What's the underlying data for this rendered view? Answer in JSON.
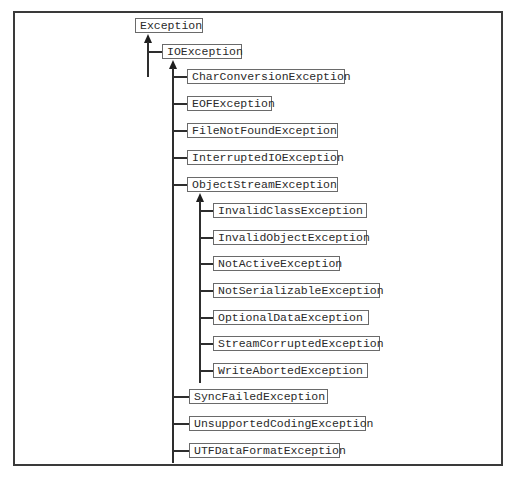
{
  "diagram": {
    "type": "class-hierarchy",
    "root": {
      "label": "Exception",
      "children": [
        {
          "label": "IOException",
          "children": [
            {
              "label": "CharConversionException"
            },
            {
              "label": "EOFException"
            },
            {
              "label": "FileNotFoundException"
            },
            {
              "label": "InterruptedIOException"
            },
            {
              "label": "ObjectStreamException",
              "children": [
                {
                  "label": "InvalidClassException"
                },
                {
                  "label": "InvalidObjectException"
                },
                {
                  "label": "NotActiveException"
                },
                {
                  "label": "NotSerializableException"
                },
                {
                  "label": "OptionalDataException"
                },
                {
                  "label": "StreamCorruptedException"
                },
                {
                  "label": "WriteAbortedException"
                }
              ]
            },
            {
              "label": "SyncFailedException"
            },
            {
              "label": "UnsupportedCodingException"
            },
            {
              "label": "UTFDataFormatException"
            }
          ]
        }
      ]
    }
  },
  "colors": {
    "line": "#2e2e2e",
    "box_border": "#6a6a6a",
    "text": "#2a2a2a",
    "background": "#ffffff"
  }
}
